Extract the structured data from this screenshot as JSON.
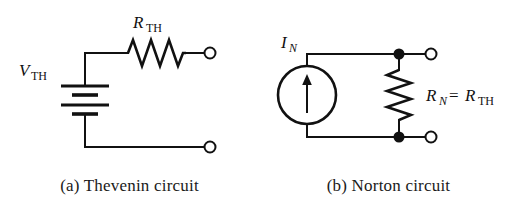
{
  "figure": {
    "background_color": "#ffffff",
    "ink_color": "#111111",
    "panels": [
      {
        "id": "thevenin",
        "caption": "(a) Thevenin circuit",
        "labels": {
          "source": {
            "symbol": "V",
            "subscript": "TH"
          },
          "resistor": {
            "symbol": "R",
            "subscript": "TH"
          }
        },
        "components": [
          {
            "name": "voltage-source-battery",
            "type": "battery",
            "plates": 4
          },
          {
            "name": "resistor-rth",
            "type": "resistor",
            "orientation": "horizontal",
            "peaks": 3
          },
          {
            "name": "terminal-top",
            "type": "open-terminal"
          },
          {
            "name": "terminal-bottom",
            "type": "open-terminal"
          }
        ]
      },
      {
        "id": "norton",
        "caption": "(b) Norton circuit",
        "labels": {
          "source": {
            "symbol": "I",
            "subscript": "N"
          },
          "resistor": {
            "symbol": "R",
            "subscript": "N",
            "equals": "=",
            "equiv_symbol": "R",
            "equiv_subscript": "TH"
          }
        },
        "components": [
          {
            "name": "current-source",
            "type": "current-source",
            "arrow_direction": "up"
          },
          {
            "name": "resistor-rn",
            "type": "resistor",
            "orientation": "vertical",
            "peaks": 4
          },
          {
            "name": "node-dot-top",
            "type": "junction-dot"
          },
          {
            "name": "node-dot-bottom",
            "type": "junction-dot"
          },
          {
            "name": "terminal-top",
            "type": "open-terminal"
          },
          {
            "name": "terminal-bottom",
            "type": "open-terminal"
          }
        ]
      }
    ]
  }
}
